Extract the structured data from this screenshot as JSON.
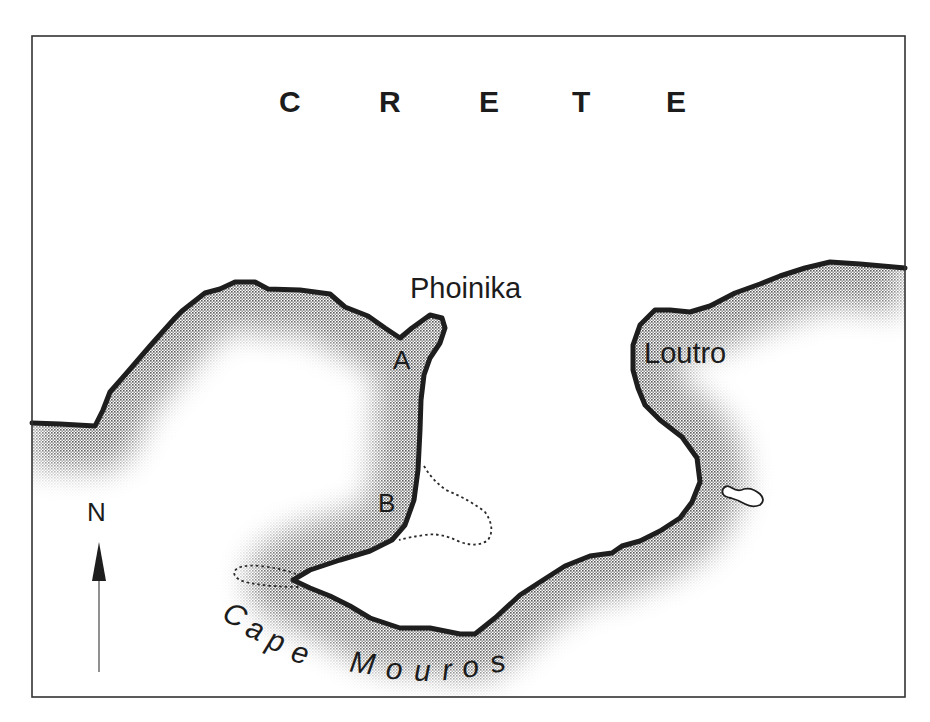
{
  "map": {
    "title_letters": [
      "C",
      "R",
      "E",
      "T",
      "E"
    ],
    "title": "CRETE",
    "places": {
      "phoinika": "Phoinika",
      "loutro": "Loutro",
      "cape": "Cape Mouros"
    },
    "markers": {
      "a": "A",
      "b": "B"
    },
    "north_label": "N",
    "cape_letters": [
      "C",
      "a",
      "p",
      "e",
      "M",
      "o",
      "u",
      "r",
      "o",
      "s"
    ],
    "colors": {
      "coastline": "#1e1e1e",
      "sea_shading": "#8a8a8a",
      "land": "#ffffff",
      "frame": "#333333",
      "text": "#1c1c1c"
    },
    "features": {
      "island": "small island east of Loutro",
      "dotted_outlines": [
        "shoal near B",
        "shoal west of Cape Mouros tip"
      ]
    }
  }
}
